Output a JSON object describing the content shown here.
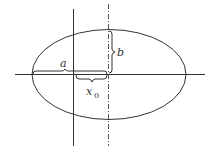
{
  "diagram": {
    "type": "ellipse-with-axes",
    "labels": {
      "a": "a",
      "b": "b",
      "x0_base": "x",
      "x0_sub": "0"
    },
    "colors": {
      "stroke": "#333333",
      "background": "#ffffff"
    }
  }
}
